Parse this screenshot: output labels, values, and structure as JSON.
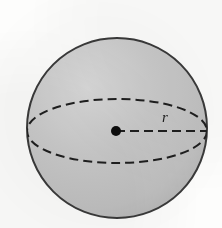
{
  "figure": {
    "kind": "geometry-diagram",
    "caption": "",
    "background_color": "#fdfdfc"
  },
  "sphere": {
    "name": "sphere-body",
    "center_x": 117,
    "center_y": 128,
    "radius_px": 90,
    "fill_color": "#c6c6c6",
    "fill_highlight_color": "#d8d8d8",
    "fill_shadow_color": "#b4b4b4",
    "outline_color": "#3a3a3a",
    "outline_width": 2
  },
  "equator": {
    "name": "equator-ellipse",
    "center_x": 117,
    "center_y": 131,
    "radius_x": 90,
    "radius_y": 32,
    "stroke_color": "#1f1f1f",
    "stroke_width": 2,
    "dash_pattern": "9 5"
  },
  "center_point": {
    "name": "center-dot",
    "x": 116,
    "y": 131,
    "radius_px": 5,
    "fill_color": "#0d0d0d"
  },
  "radius_segment": {
    "name": "radius-line",
    "x1": 116,
    "y1": 131,
    "x2": 207,
    "y2": 131,
    "stroke_color": "#1f1f1f",
    "stroke_width": 2,
    "dash_pattern": "9 5"
  },
  "labels": {
    "radius": {
      "text": "r",
      "x": 162,
      "y": 110
    }
  }
}
